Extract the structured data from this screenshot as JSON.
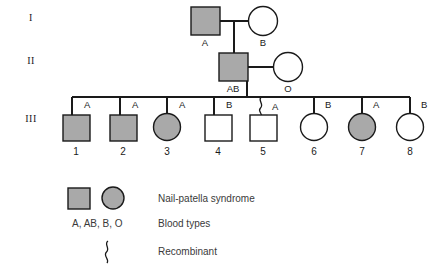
{
  "figure": {
    "affected_fill_color": "#a9a9a9",
    "unaffected_fill_color": "#ffffff",
    "line_color": "#1a1a1a"
  },
  "generation_labels": [
    {
      "id": "gen-I",
      "label": "I"
    },
    {
      "id": "gen-II",
      "label": "II"
    },
    {
      "id": "gen-III",
      "label": "III"
    }
  ],
  "generations": {
    "I": {
      "label": "I",
      "individuals": [
        {
          "id": "I-1",
          "sex": "male",
          "shape": "square",
          "affected": true,
          "blood_type": "A",
          "number": ""
        },
        {
          "id": "I-2",
          "sex": "female",
          "shape": "circle",
          "affected": false,
          "blood_type": "B",
          "number": ""
        }
      ]
    },
    "II": {
      "label": "II",
      "individuals": [
        {
          "id": "II-1",
          "sex": "male",
          "shape": "square",
          "affected": true,
          "blood_type": "AB",
          "number": ""
        },
        {
          "id": "II-2",
          "sex": "female",
          "shape": "circle",
          "affected": false,
          "blood_type": "O",
          "number": ""
        }
      ]
    },
    "III": {
      "label": "III",
      "individuals": [
        {
          "id": "III-1",
          "sex": "male",
          "shape": "square",
          "affected": true,
          "blood_type": "A",
          "number": "1",
          "recombinant": false
        },
        {
          "id": "III-2",
          "sex": "male",
          "shape": "square",
          "affected": true,
          "blood_type": "A",
          "number": "2",
          "recombinant": false
        },
        {
          "id": "III-3",
          "sex": "female",
          "shape": "circle",
          "affected": true,
          "blood_type": "A",
          "number": "3",
          "recombinant": false
        },
        {
          "id": "III-4",
          "sex": "male",
          "shape": "square",
          "affected": false,
          "blood_type": "B",
          "number": "4",
          "recombinant": false
        },
        {
          "id": "III-5",
          "sex": "male",
          "shape": "square",
          "affected": false,
          "blood_type": "A",
          "number": "5",
          "recombinant": true
        },
        {
          "id": "III-6",
          "sex": "female",
          "shape": "circle",
          "affected": false,
          "blood_type": "B",
          "number": "6",
          "recombinant": false
        },
        {
          "id": "III-7",
          "sex": "female",
          "shape": "circle",
          "affected": true,
          "blood_type": "A",
          "number": "7",
          "recombinant": false
        },
        {
          "id": "III-8",
          "sex": "female",
          "shape": "circle",
          "affected": false,
          "blood_type": "B",
          "number": "8",
          "recombinant": false
        }
      ]
    }
  },
  "legend": {
    "rows": [
      {
        "key": "affected-symbols",
        "symbol": "filled-square-and-circle",
        "label": "Nail-patella syndrome"
      },
      {
        "key": "blood-types",
        "symbol": "A, AB, B, O",
        "label": "Blood types"
      },
      {
        "key": "recombinant",
        "symbol": "squiggle",
        "label": "Recombinant"
      }
    ],
    "blood_type_key": "A, AB, B, O",
    "nail_patella_label": "Nail-patella syndrome",
    "blood_types_label": "Blood types",
    "recombinant_label": "Recombinant"
  }
}
